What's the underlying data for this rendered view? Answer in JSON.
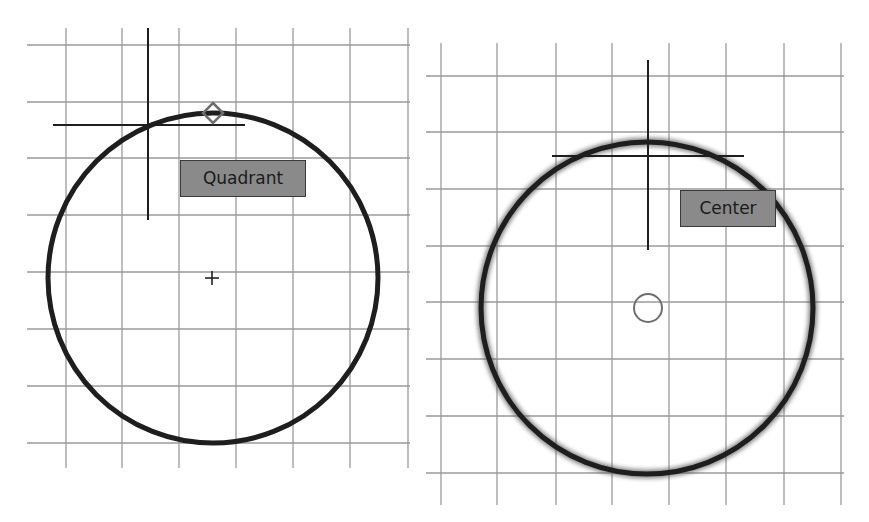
{
  "panels": [
    {
      "id": "left",
      "snap_label": "Quadrant",
      "snap_marker": "diamond",
      "center_marker": "plus",
      "label_box": {
        "x": 180,
        "y": 160,
        "w": 126,
        "h": 37
      },
      "grid": {
        "vx": [
          66,
          122,
          179,
          236,
          293,
          350,
          408
        ],
        "hy": [
          45,
          102,
          158,
          215,
          272,
          329,
          386,
          443
        ],
        "x0": 27,
        "x1": 410,
        "y0": 28,
        "y1": 468
      },
      "circle": {
        "cx": 213,
        "cy": 278,
        "r": 165,
        "glow": false
      },
      "crosshair": {
        "x": 148,
        "y": 125,
        "vy0": 28,
        "vy1": 220,
        "hx0": 53,
        "hx1": 245
      },
      "diamond": {
        "x": 213,
        "y": 113,
        "s": 10
      },
      "plus": {
        "x": 212,
        "y": 278,
        "s": 7
      }
    },
    {
      "id": "right",
      "snap_label": "Center",
      "snap_marker": "circle",
      "label_box": {
        "x": 680,
        "y": 190,
        "w": 96,
        "h": 37
      },
      "grid": {
        "vx": [
          441,
          497,
          556,
          612,
          669,
          726,
          784,
          841
        ],
        "hy": [
          76,
          132,
          189,
          246,
          302,
          359,
          416,
          473
        ],
        "x0": 426,
        "x1": 844,
        "y0": 43,
        "y1": 505
      },
      "circle": {
        "cx": 647,
        "cy": 308,
        "r": 166,
        "glow": true
      },
      "crosshair": {
        "x": 648,
        "y": 156,
        "vy0": 60,
        "vy1": 250,
        "hx0": 552,
        "hx1": 744
      },
      "center_circle": {
        "x": 648,
        "y": 308,
        "r": 14
      }
    }
  ],
  "colors": {
    "grid": "#9a9a9a",
    "circle": "#1e1e1e",
    "crosshair": "#1e1e1e",
    "label_bg": "#8a8a8a",
    "label_text": "#1a1a1a",
    "marker": "#6e6e6e"
  }
}
